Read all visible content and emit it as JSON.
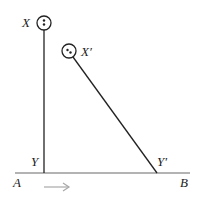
{
  "diagram": {
    "labels": {
      "x": "X",
      "x_prime": "X′",
      "y": "Y",
      "y_prime": "Y′",
      "a": "A",
      "b": "B"
    },
    "colors": {
      "line": "#222222",
      "baseline": "#9a9a9a",
      "arrow": "#a8a8a8"
    },
    "icons": {
      "arrow": "right-arrow"
    }
  }
}
